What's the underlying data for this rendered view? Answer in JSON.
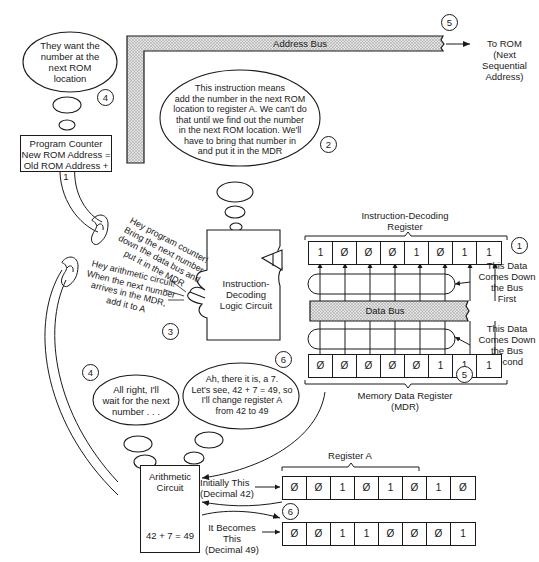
{
  "address_bus": {
    "label": "Address Bus",
    "step": "5",
    "destination_line1": "To ROM",
    "destination_line2": "(Next Sequential",
    "destination_line3": "Address)"
  },
  "thought_pc": {
    "step": "4",
    "lines": [
      "They want the",
      "number at the",
      "next ROM",
      "location"
    ]
  },
  "program_counter": {
    "line1": "Program Counter",
    "line2": "New ROM Address =",
    "line3": "Old ROM Address + 1"
  },
  "thought_decoder": {
    "step": "2",
    "lines": [
      "This instruction means",
      "add the number in the next ROM",
      "location to register A. We can't do",
      "that until we find out the number",
      "in the next ROM location. We'll",
      "have to bring that number in",
      "and put it in the MDR"
    ]
  },
  "speech_to_pc": {
    "lines": [
      "Hey program counter!",
      "Bring the next number",
      "down the data bus and",
      "put it in the MDR"
    ]
  },
  "speech_to_alu": {
    "lines": [
      "Hey arithmetic circuit!",
      "When the next number",
      "arrives in the MDR,",
      "add it to A"
    ]
  },
  "decoder_circuit": {
    "step": "3",
    "line1": "Instruction-",
    "line2": "Decoding",
    "line3": "Logic Circuit"
  },
  "instruction_register": {
    "title_line1": "Instruction-Decoding",
    "title_line2": "Register",
    "step": "1",
    "bits": [
      "1",
      "Ø",
      "Ø",
      "Ø",
      "1",
      "Ø",
      "1",
      "1"
    ],
    "note_line1": "This Data",
    "note_line2": "Comes Down",
    "note_line3": "the Bus",
    "note_line4": "First"
  },
  "data_bus": {
    "label": "Data Bus"
  },
  "mdr": {
    "title_line1": "Memory Data Register",
    "title_line2": "(MDR)",
    "step": "5",
    "bits": [
      "Ø",
      "Ø",
      "Ø",
      "Ø",
      "Ø",
      "1",
      "1",
      "1"
    ],
    "note_line1": "This Data",
    "note_line2": "Comes Down",
    "note_line3": "the Bus",
    "note_line4": "Second"
  },
  "thought_alu_wait": {
    "step": "4",
    "lines": [
      "All right, I'll",
      "wait for the next",
      "number . . ."
    ]
  },
  "thought_alu_add": {
    "step": "6",
    "lines": [
      "Ah, there it is, a 7.",
      "Let's see, 42 + 7 = 49, so",
      "I'll change register A",
      "from 42 to 49"
    ]
  },
  "arithmetic_circuit": {
    "line1": "Arithmetic",
    "line2": "Circuit",
    "equation": "42 + 7 = 49"
  },
  "register_a": {
    "title": "Register A",
    "step": "6",
    "initial_label_line1": "Initially This",
    "initial_label_line2": "(Decimal 42)",
    "initial_bits": [
      "Ø",
      "Ø",
      "1",
      "Ø",
      "1",
      "Ø",
      "1",
      "Ø"
    ],
    "final_label_line1": "It Becomes This",
    "final_label_line2": "(Decimal 49)",
    "final_bits": [
      "Ø",
      "Ø",
      "1",
      "1",
      "Ø",
      "Ø",
      "Ø",
      "1"
    ]
  },
  "colors": {
    "ink": "#1a1a1a",
    "bus_fill": "#cfcfcf",
    "background": "#ffffff"
  }
}
